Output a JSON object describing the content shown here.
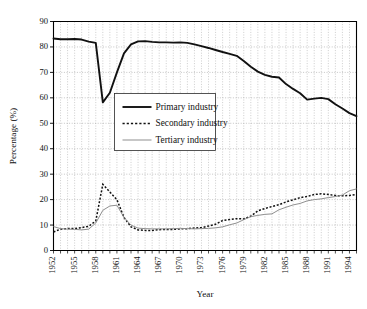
{
  "chart_data": {
    "type": "line",
    "title": "",
    "xlabel": "Year",
    "ylabel": "Percentage (%)",
    "xlim": [
      1952,
      1995
    ],
    "ylim": [
      0,
      90
    ],
    "ytick_step": 10,
    "xtick_step": 3,
    "grid": "dotted both axes",
    "legend_position": "upper-left-inside",
    "yticks": [
      "0",
      "10",
      "20",
      "30",
      "40",
      "50",
      "60",
      "70",
      "80",
      "90"
    ],
    "xticks": [
      "1952",
      "1955",
      "1958",
      "1961",
      "1964",
      "1967",
      "1970",
      "1973",
      "1976",
      "1979",
      "1982",
      "1985",
      "1988",
      "1991",
      "1994"
    ],
    "x": [
      1952,
      1953,
      1954,
      1955,
      1956,
      1957,
      1958,
      1959,
      1960,
      1961,
      1962,
      1963,
      1964,
      1965,
      1966,
      1967,
      1968,
      1969,
      1970,
      1971,
      1972,
      1973,
      1974,
      1975,
      1976,
      1977,
      1978,
      1979,
      1980,
      1981,
      1982,
      1983,
      1984,
      1985,
      1986,
      1987,
      1988,
      1989,
      1990,
      1991,
      1992,
      1993,
      1994,
      1995
    ],
    "series": [
      {
        "name": "Primary industry",
        "style": "solid-thick",
        "color": "#111111",
        "values": [
          83.3,
          83.0,
          83.0,
          83.1,
          82.9,
          82.1,
          81.6,
          58.2,
          62.0,
          70.0,
          77.5,
          81.0,
          82.2,
          82.3,
          82.0,
          81.8,
          81.8,
          81.7,
          81.8,
          81.6,
          81.0,
          80.3,
          79.6,
          78.8,
          78.0,
          77.3,
          76.5,
          74.5,
          72.2,
          70.3,
          69.0,
          68.3,
          68.0,
          65.4,
          63.5,
          61.8,
          59.3,
          59.7,
          60.0,
          59.5,
          57.5,
          55.8,
          54.0,
          52.8
        ]
      },
      {
        "name": "Secondary industry",
        "style": "dashed",
        "color": "#111111",
        "values": [
          7.3,
          8.4,
          8.6,
          8.6,
          9.0,
          9.5,
          11.6,
          26.0,
          23.0,
          20.0,
          13.0,
          9.3,
          8.1,
          7.9,
          7.9,
          8.2,
          8.3,
          8.3,
          8.5,
          8.6,
          8.8,
          9.0,
          9.6,
          10.3,
          11.8,
          12.2,
          12.5,
          12.4,
          13.5,
          15.6,
          16.5,
          17.3,
          18.0,
          19.1,
          19.9,
          20.8,
          21.2,
          22.0,
          22.3,
          22.0,
          21.6,
          21.5,
          21.6,
          22.0
        ]
      },
      {
        "name": "Tertiary industry",
        "style": "thin-gray",
        "color": "#8f8f8f",
        "values": [
          9.4,
          8.6,
          8.4,
          8.3,
          8.1,
          8.4,
          10.8,
          15.8,
          17.5,
          17.8,
          13.0,
          10.0,
          8.8,
          8.6,
          8.5,
          8.5,
          8.5,
          8.6,
          8.7,
          8.6,
          8.5,
          8.6,
          8.7,
          8.9,
          9.3,
          10.1,
          10.8,
          12.1,
          13.3,
          13.8,
          14.2,
          14.4,
          16.0,
          17.0,
          17.9,
          18.5,
          19.5,
          20.0,
          20.3,
          20.8,
          21.2,
          21.8,
          23.5,
          24.2
        ]
      }
    ]
  },
  "legend": {
    "items": [
      {
        "label": "Primary industry"
      },
      {
        "label": "Secondary industry"
      },
      {
        "label": "Tertiary industry"
      }
    ]
  }
}
